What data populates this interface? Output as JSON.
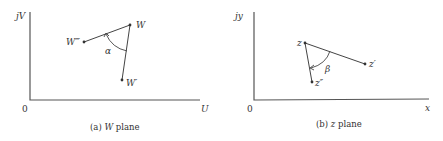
{
  "panels": [
    {
      "id": "w-plane",
      "caption_prefix": "(a) ",
      "caption_var": "W",
      "caption_suffix": " plane",
      "y_axis_label": "jV",
      "x_axis_label": "U",
      "origin_label": "0",
      "points": [
        {
          "label": "W",
          "x": 130,
          "y": 25
        },
        {
          "label": "W‴",
          "x": 84,
          "y": 42
        },
        {
          "label": "W′",
          "x": 122,
          "y": 80
        }
      ],
      "angle_label": "α"
    },
    {
      "id": "z-plane",
      "caption_prefix": "(b) ",
      "caption_var": "z",
      "caption_suffix": " plane",
      "y_axis_label": "jy",
      "x_axis_label": "x",
      "origin_label": "0",
      "points": [
        {
          "label": "z",
          "x": 305,
          "y": 43
        },
        {
          "label": "z′",
          "x": 365,
          "y": 64
        },
        {
          "label": "z″",
          "x": 312,
          "y": 82
        }
      ],
      "angle_label": "β"
    }
  ]
}
